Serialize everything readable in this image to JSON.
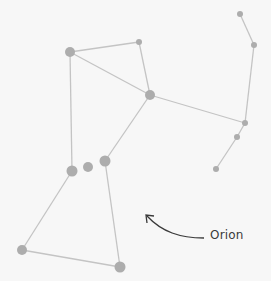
{
  "title": "Orion",
  "label": "Orion",
  "colors": {
    "background": "#f7f7f7",
    "star": "#adadad",
    "line": "#c4c4c4",
    "arrow": "#3a3a3a",
    "text": "#3a3a3a"
  },
  "stars": [
    {
      "id": "A",
      "x": 70,
      "y": 52,
      "r": 5
    },
    {
      "id": "B",
      "x": 139,
      "y": 42,
      "r": 3
    },
    {
      "id": "C",
      "x": 150,
      "y": 95,
      "r": 5
    },
    {
      "id": "D",
      "x": 240,
      "y": 14,
      "r": 3
    },
    {
      "id": "E",
      "x": 254,
      "y": 45,
      "r": 3
    },
    {
      "id": "F",
      "x": 245,
      "y": 123,
      "r": 3
    },
    {
      "id": "G",
      "x": 237,
      "y": 137,
      "r": 3
    },
    {
      "id": "H",
      "x": 216,
      "y": 169,
      "r": 3
    },
    {
      "id": "I",
      "x": 72,
      "y": 171,
      "r": 5.5
    },
    {
      "id": "J",
      "x": 88,
      "y": 167,
      "r": 5
    },
    {
      "id": "K",
      "x": 105,
      "y": 161,
      "r": 5.5
    },
    {
      "id": "L",
      "x": 22,
      "y": 250,
      "r": 5
    },
    {
      "id": "M",
      "x": 120,
      "y": 267,
      "r": 5.5
    }
  ],
  "lines": [
    [
      "A",
      "B"
    ],
    [
      "A",
      "C"
    ],
    [
      "B",
      "C"
    ],
    [
      "A",
      "I"
    ],
    [
      "C",
      "K"
    ],
    [
      "C",
      "F"
    ],
    [
      "D",
      "E"
    ],
    [
      "E",
      "F"
    ],
    [
      "F",
      "G"
    ],
    [
      "G",
      "H"
    ],
    [
      "I",
      "L"
    ],
    [
      "K",
      "M"
    ],
    [
      "L",
      "M"
    ]
  ]
}
